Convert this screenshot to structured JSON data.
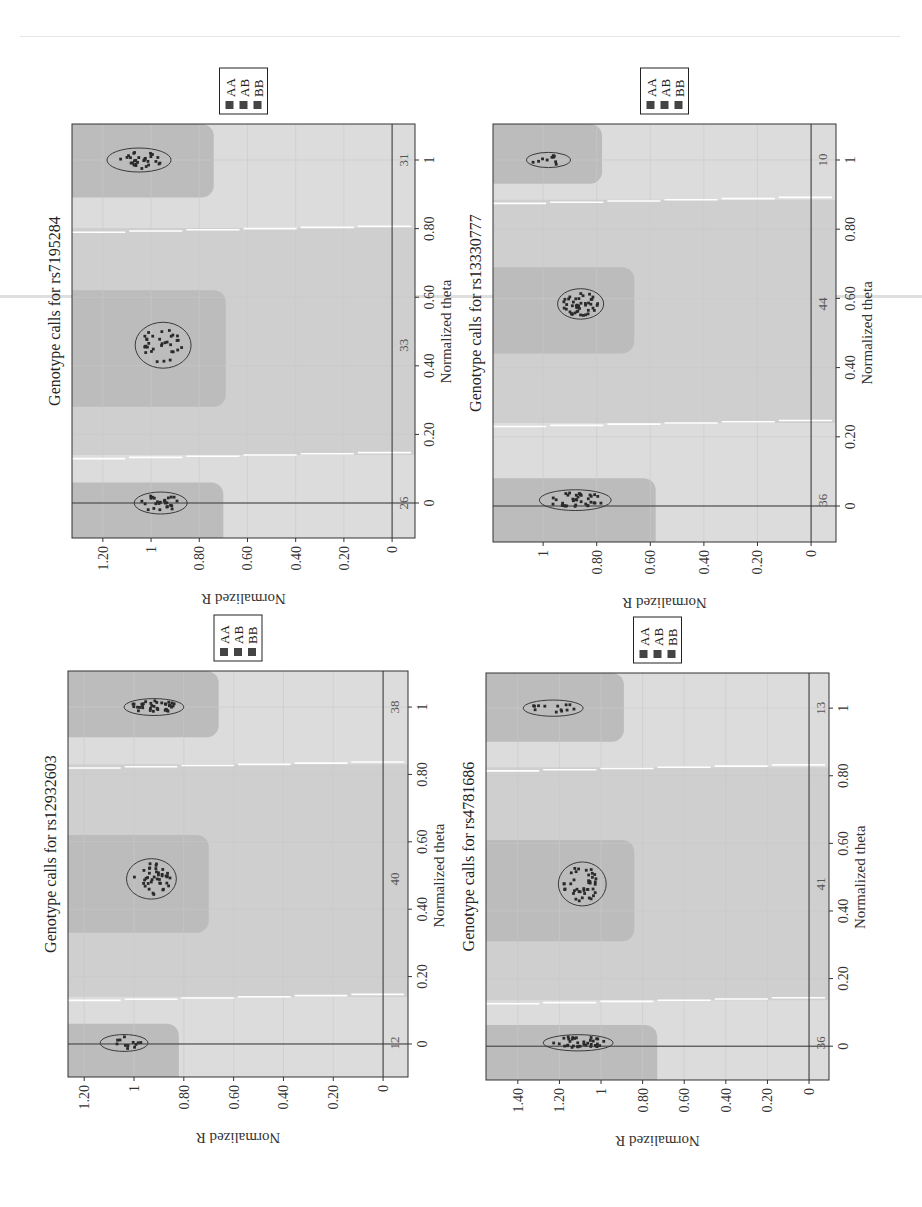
{
  "page": {
    "orientation": "rotated -90deg (text reads bottom-to-top)"
  },
  "legend": {
    "items": [
      "AA",
      "AB",
      "BB"
    ],
    "swatch_color": "#444444"
  },
  "colors": {
    "plot_bg": "#dcdcdc",
    "mid_band": "#cfcfcf",
    "cluster_region": "#bcbcbc",
    "separator": "#ffffff",
    "axis": "#333333",
    "dot": "#2a2a2a",
    "ellipse": "#3a3a3a"
  },
  "chart_data": [
    {
      "type": "scatter",
      "id": "rs7195284",
      "title": "Genotype calls for rs7195284",
      "xlabel": "Normalized theta",
      "ylabel": "Normalized R",
      "xlim": [
        -0.102,
        1.105
      ],
      "ylim": [
        -0.095,
        1.328
      ],
      "xticks": [
        "0",
        "0.20",
        "0.40",
        "0.60",
        "0.80",
        "1"
      ],
      "xtick_values": [
        0,
        0.2,
        0.4,
        0.6,
        0.8,
        1
      ],
      "yticks": [
        "0",
        "0.20",
        "0.40",
        "0.60",
        "0.80",
        "1",
        "1.20"
      ],
      "ytick_values": [
        0,
        0.2,
        0.4,
        0.6,
        0.8,
        1,
        1.2
      ],
      "legend": [
        "AA",
        "AB",
        "BB"
      ],
      "separators": [
        0.14,
        0.8
      ],
      "regions": [
        {
          "genotype": "AA",
          "theta": [
            -0.102,
            0.06
          ],
          "r_min": 0.7
        },
        {
          "genotype": "AB",
          "theta": [
            0.31,
            0.62
          ],
          "r_min": 0.69
        },
        {
          "genotype": "BB",
          "theta": [
            0.92,
            1.105
          ],
          "r_min": 0.74
        }
      ],
      "clusters": [
        {
          "genotype": "AA",
          "theta": 0.0,
          "r": 0.96,
          "theta_radius": 0.032,
          "r_radius": 0.11,
          "count": 26
        },
        {
          "genotype": "AB",
          "theta": 0.46,
          "r": 0.95,
          "theta_radius": 0.067,
          "r_radius": 0.116,
          "count": 33
        },
        {
          "genotype": "BB",
          "theta": 1.0,
          "r": 1.05,
          "theta_radius": 0.035,
          "r_radius": 0.133,
          "count": 31
        }
      ],
      "frame": {
        "left": 72,
        "top": 538,
        "width": 414,
        "height": 343
      }
    },
    {
      "type": "scatter",
      "id": "rs13330777",
      "title": "Genotype calls for rs13330777",
      "xlabel": "Normalized theta",
      "ylabel": "Normalized R",
      "xlim": [
        -0.104,
        1.104
      ],
      "ylim": [
        -0.093,
        1.187
      ],
      "xticks": [
        "0",
        "0.20",
        "0.40",
        "0.60",
        "0.80",
        "1"
      ],
      "xtick_values": [
        0,
        0.2,
        0.4,
        0.6,
        0.8,
        1
      ],
      "yticks": [
        "0",
        "0.20",
        "0.40",
        "0.60",
        "0.80",
        "1"
      ],
      "ytick_values": [
        0,
        0.2,
        0.4,
        0.6,
        0.8,
        1
      ],
      "legend": [
        "AA",
        "AB",
        "BB"
      ],
      "separators": [
        0.24,
        0.885
      ],
      "regions": [
        {
          "genotype": "AA",
          "theta": [
            -0.104,
            0.08
          ],
          "r_min": 0.58
        },
        {
          "genotype": "AB",
          "theta": [
            0.47,
            0.69
          ],
          "r_min": 0.66
        },
        {
          "genotype": "BB",
          "theta": [
            0.96,
            1.104
          ],
          "r_min": 0.78
        }
      ],
      "clusters": [
        {
          "genotype": "AA",
          "theta": 0.017,
          "r": 0.88,
          "theta_radius": 0.03,
          "r_radius": 0.134,
          "count": 36
        },
        {
          "genotype": "AB",
          "theta": 0.584,
          "r": 0.86,
          "theta_radius": 0.044,
          "r_radius": 0.086,
          "count": 44
        },
        {
          "genotype": "BB",
          "theta": 1.0,
          "r": 0.98,
          "theta_radius": 0.022,
          "r_radius": 0.082,
          "count": 10
        }
      ],
      "frame": {
        "left": 493,
        "top": 542,
        "width": 418,
        "height": 343
      }
    },
    {
      "type": "scatter",
      "id": "rs12932603",
      "title": "Genotype calls for rs12932603",
      "xlabel": "Normalized theta",
      "ylabel": "Normalized R",
      "xlim": [
        -0.098,
        1.107
      ],
      "ylim": [
        -0.1,
        1.265
      ],
      "xticks": [
        "0",
        "0.20",
        "0.40",
        "0.60",
        "0.80",
        "1"
      ],
      "xtick_values": [
        0,
        0.2,
        0.4,
        0.6,
        0.8,
        1
      ],
      "yticks": [
        "0",
        "0.20",
        "0.40",
        "0.60",
        "0.80",
        "1",
        "1.20"
      ],
      "ytick_values": [
        0,
        0.2,
        0.4,
        0.6,
        0.8,
        1,
        1.2
      ],
      "legend": [
        "AA",
        "AB",
        "BB"
      ],
      "separators": [
        0.14,
        0.83
      ],
      "regions": [
        {
          "genotype": "AA",
          "theta": [
            -0.098,
            0.06
          ],
          "r_min": 0.82
        },
        {
          "genotype": "AB",
          "theta": [
            0.36,
            0.62
          ],
          "r_min": 0.7
        },
        {
          "genotype": "BB",
          "theta": [
            0.94,
            1.107
          ],
          "r_min": 0.66
        }
      ],
      "clusters": [
        {
          "genotype": "AA",
          "theta": 0.003,
          "r": 1.04,
          "theta_radius": 0.025,
          "r_radius": 0.096,
          "count": 12
        },
        {
          "genotype": "AB",
          "theta": 0.49,
          "r": 0.93,
          "theta_radius": 0.06,
          "r_radius": 0.1,
          "count": 40
        },
        {
          "genotype": "BB",
          "theta": 1.0,
          "r": 0.92,
          "theta_radius": 0.025,
          "r_radius": 0.12,
          "count": 38
        }
      ],
      "frame": {
        "left": 68,
        "top": 1077,
        "width": 406,
        "height": 340
      }
    },
    {
      "type": "scatter",
      "id": "rs4781686",
      "title": "Genotype calls for rs4781686",
      "xlabel": "Normalized theta",
      "ylabel": "Normalized R",
      "xlim": [
        -0.1,
        1.104
      ],
      "ylim": [
        -0.096,
        1.553
      ],
      "xticks": [
        "0",
        "0.20",
        "0.40",
        "0.60",
        "0.80",
        "1"
      ],
      "xtick_values": [
        0,
        0.2,
        0.4,
        0.6,
        0.8,
        1
      ],
      "yticks": [
        "0",
        "0.20",
        "0.40",
        "0.60",
        "0.80",
        "1",
        "1.20",
        "1.40"
      ],
      "ytick_values": [
        0,
        0.2,
        0.4,
        0.6,
        0.8,
        1,
        1.2,
        1.4
      ],
      "legend": [
        "AA",
        "AB",
        "BB"
      ],
      "separators": [
        0.136,
        0.825
      ],
      "regions": [
        {
          "genotype": "AA",
          "theta": [
            -0.1,
            0.063
          ],
          "r_min": 0.73
        },
        {
          "genotype": "AB",
          "theta": [
            0.34,
            0.61
          ],
          "r_min": 0.84
        },
        {
          "genotype": "BB",
          "theta": [
            0.93,
            1.104
          ],
          "r_min": 0.89
        }
      ],
      "clusters": [
        {
          "genotype": "AA",
          "theta": 0.01,
          "r": 1.11,
          "theta_radius": 0.024,
          "r_radius": 0.168,
          "count": 36
        },
        {
          "genotype": "AB",
          "theta": 0.48,
          "r": 1.09,
          "theta_radius": 0.065,
          "r_radius": 0.115,
          "count": 41
        },
        {
          "genotype": "BB",
          "theta": 1.0,
          "r": 1.23,
          "theta_radius": 0.024,
          "r_radius": 0.144,
          "count": 13
        }
      ],
      "frame": {
        "left": 486,
        "top": 1080,
        "width": 407,
        "height": 343
      }
    }
  ]
}
